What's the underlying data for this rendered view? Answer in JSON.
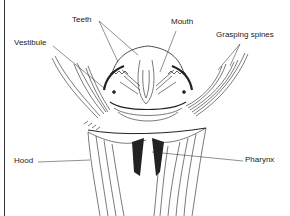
{
  "figure": {
    "type": "anatomical line drawing",
    "labels": {
      "teeth": "Teeth",
      "mouth": "Mouth",
      "grasping_spines": "Grasping spines",
      "vestibule": "Vestibule",
      "hood": "Hood",
      "pharynx": "Pharynx"
    },
    "colors": {
      "ink": "#222222",
      "background": "#ffffff"
    }
  }
}
